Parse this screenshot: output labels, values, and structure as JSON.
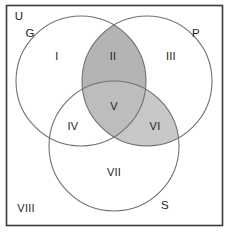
{
  "figure": {
    "frame": {
      "name": "universe-frame",
      "border_color": "#3a3a3a",
      "background_color": "#ffffff"
    }
  },
  "colors": {
    "outline": "#6f6f6f",
    "frame_border": "#3a3a3a",
    "text": "#1c1c1c",
    "shade_dark": "#b4b4b4",
    "shade_mid": "#bdbdbd",
    "shade_light": "#c8c8c8",
    "unshaded": "#ffffff"
  },
  "sets": [
    {
      "id": "U",
      "label": "U",
      "name": "universal-set-label",
      "x": 19,
      "y": 17,
      "shaded": false
    },
    {
      "id": "G",
      "label": "G",
      "name": "set-g-label",
      "x": 30,
      "y": 34,
      "shaded": false
    },
    {
      "id": "P",
      "label": "P",
      "name": "set-p-label",
      "x": 196,
      "y": 34,
      "shaded": false
    },
    {
      "id": "S",
      "label": "S",
      "name": "set-s-label",
      "x": 165,
      "y": 206,
      "shaded": false
    }
  ],
  "circles": [
    {
      "id": "G",
      "name": "circle-g",
      "cx": 81,
      "cy": 81,
      "r": 65
    },
    {
      "id": "P",
      "name": "circle-p",
      "cx": 147,
      "cy": 81,
      "r": 65
    },
    {
      "id": "S",
      "name": "circle-s",
      "cx": 114,
      "cy": 146,
      "r": 65
    }
  ],
  "regions": [
    {
      "id": "I",
      "label": "I",
      "name": "region-i",
      "x": 57,
      "y": 57,
      "membership": "G only",
      "shaded": false
    },
    {
      "id": "II",
      "label": "II",
      "name": "region-ii",
      "x": 113,
      "y": 57,
      "membership": "G and P",
      "shaded": true
    },
    {
      "id": "III",
      "label": "III",
      "name": "region-iii",
      "x": 171,
      "y": 57,
      "membership": "P only",
      "shaded": false
    },
    {
      "id": "IV",
      "label": "IV",
      "name": "region-iv",
      "x": 73,
      "y": 127,
      "membership": "G and S",
      "shaded": false
    },
    {
      "id": "V",
      "label": "V",
      "name": "region-v",
      "x": 114,
      "y": 107,
      "membership": "G, P and S",
      "shaded": true
    },
    {
      "id": "VI",
      "label": "VI",
      "name": "region-vi",
      "x": 155,
      "y": 127,
      "membership": "P and S",
      "shaded": true
    },
    {
      "id": "VII",
      "label": "VII",
      "name": "region-vii",
      "x": 114,
      "y": 173,
      "membership": "S only",
      "shaded": false
    },
    {
      "id": "VIII",
      "label": "VIII",
      "name": "region-viii",
      "x": 26,
      "y": 209,
      "membership": "outside all sets",
      "shaded": false
    }
  ]
}
